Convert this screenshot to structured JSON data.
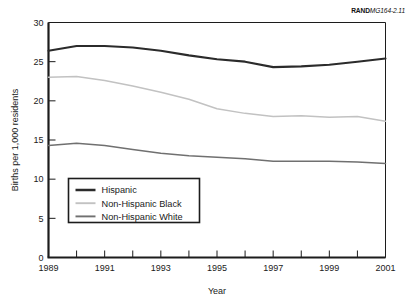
{
  "credit": {
    "brand": "RAND",
    "id": "MG164-2.11"
  },
  "chart_data": {
    "type": "line",
    "title": "",
    "xlabel": "Year",
    "ylabel": "Births per 1,000 residents",
    "xlim": [
      1989,
      2001
    ],
    "ylim": [
      0,
      30
    ],
    "yticks": [
      0,
      5,
      10,
      15,
      20,
      25,
      30
    ],
    "ytick_labels": [
      "0",
      "5",
      "10",
      "15",
      "20",
      "25",
      "30"
    ],
    "xticks": [
      1989,
      1990,
      1991,
      1992,
      1993,
      1994,
      1995,
      1996,
      1997,
      1998,
      1999,
      2000,
      2001
    ],
    "xtick_labels": [
      "1989",
      "",
      "1991",
      "",
      "1993",
      "",
      "1995",
      "",
      "1997",
      "",
      "1999",
      "",
      "2001"
    ],
    "grid": false,
    "legend_position": "lower left inside",
    "x": [
      1989,
      1990,
      1991,
      1992,
      1993,
      1994,
      1995,
      1996,
      1997,
      1998,
      1999,
      2000,
      2001
    ],
    "series": [
      {
        "name": "Hispanic",
        "color": "#2b2b2b",
        "width": 2.1,
        "values": [
          26.4,
          27.0,
          27.0,
          26.8,
          26.4,
          25.8,
          25.3,
          25.0,
          24.3,
          24.4,
          24.6,
          25.0,
          25.4
        ]
      },
      {
        "name": "Non-Hispanic Black",
        "color": "#c2c2c2",
        "width": 1.5,
        "values": [
          23.0,
          23.1,
          22.6,
          21.9,
          21.1,
          20.2,
          19.0,
          18.4,
          18.0,
          18.1,
          17.9,
          18.0,
          17.4
        ]
      },
      {
        "name": "Non-Hispanic White",
        "color": "#707070",
        "width": 1.5,
        "values": [
          14.3,
          14.6,
          14.3,
          13.8,
          13.3,
          13.0,
          12.8,
          12.6,
          12.3,
          12.3,
          12.3,
          12.2,
          12.0
        ]
      }
    ]
  }
}
